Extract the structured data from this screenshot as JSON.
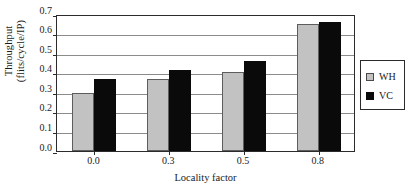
{
  "chart_data": {
    "type": "bar",
    "title": "",
    "xlabel": "Locality factor",
    "ylabel": "Throughput (flits/cycle/IP)",
    "ylabel_line1": "Throughput",
    "ylabel_line2": "(flits/cycle/IP)",
    "categories": [
      "0.0",
      "0.3",
      "0.5",
      "0.8"
    ],
    "series": [
      {
        "name": "WH",
        "color": "#c2c2c2",
        "values": [
          0.295,
          0.366,
          0.406,
          0.648
        ]
      },
      {
        "name": "VC",
        "color": "#0a0a0a",
        "values": [
          0.366,
          0.412,
          0.461,
          0.658
        ]
      }
    ],
    "ylim": [
      0.0,
      0.7
    ],
    "ytick_values": [
      0.0,
      0.1,
      0.2,
      0.3,
      0.4,
      0.5,
      0.6,
      0.7
    ],
    "ytick_labels": [
      "0.0",
      "0.1",
      "0.2",
      "0.3",
      "0.4",
      "0.5",
      "0.6",
      "0.7"
    ],
    "grid": true,
    "grid_axis": "y",
    "legend_position": "right-outside",
    "legend_entries": [
      "WH",
      "VC"
    ]
  }
}
